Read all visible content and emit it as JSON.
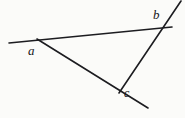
{
  "figure": {
    "type": "geometry-diagram",
    "background_color": "#fbfbf9",
    "line_color": "#1c1c20",
    "label_color": "#16161a",
    "canvas": {
      "width": 185,
      "height": 118
    },
    "labels": {
      "a": "a",
      "b": "b",
      "c": "c"
    },
    "vertices": [
      {
        "name": "a",
        "x": 38,
        "y": 40
      },
      {
        "name": "b",
        "x": 165,
        "y": 28
      },
      {
        "name": "c",
        "x": 121,
        "y": 92
      }
    ],
    "lines": [
      {
        "name": "line-ab",
        "from": "a",
        "to": "b",
        "x1": 9,
        "y1": 43,
        "x2": 172,
        "y2": 27,
        "stroke_width": 1.6
      },
      {
        "name": "line-ac",
        "from": "a",
        "to": "c",
        "x1": 37,
        "y1": 39,
        "x2": 148,
        "y2": 108,
        "stroke_width": 1.6
      },
      {
        "name": "line-bc",
        "from": "b",
        "to": "c",
        "x1": 181,
        "y1": 1,
        "x2": 119,
        "y2": 93,
        "stroke_width": 1.6
      }
    ]
  }
}
